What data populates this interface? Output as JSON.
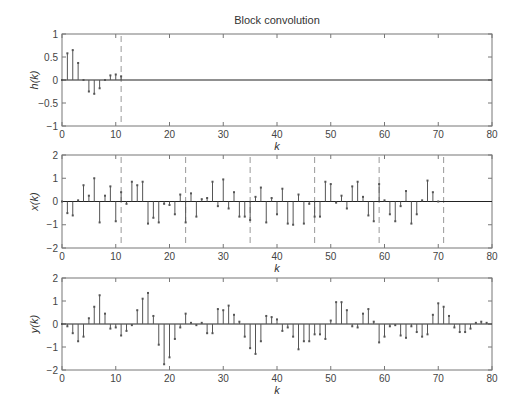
{
  "title": "Block convolution",
  "chart_data": [
    {
      "type": "stem",
      "title": "Block convolution",
      "xlabel": "k",
      "ylabel": "h(k)",
      "xlim": [
        0,
        80
      ],
      "ylim": [
        -1,
        1
      ],
      "xticks": [
        0,
        10,
        20,
        30,
        40,
        50,
        60,
        70,
        80
      ],
      "yticks": [
        -1,
        -0.5,
        0,
        0.5,
        1
      ],
      "ytick_labels": [
        "−1",
        "−0.5",
        "0",
        "0.5",
        "1"
      ],
      "block_boundaries": [
        11
      ],
      "x": [
        0,
        1,
        2,
        3,
        4,
        5,
        6,
        7,
        8,
        9,
        10,
        11
      ],
      "values": [
        0,
        0.58,
        0.65,
        0.37,
        0,
        -0.25,
        -0.3,
        -0.18,
        0,
        0.1,
        0.12,
        0.08
      ]
    },
    {
      "type": "stem",
      "xlabel": "k",
      "ylabel": "x(k)",
      "xlim": [
        0,
        80
      ],
      "ylim": [
        -2,
        2
      ],
      "xticks": [
        0,
        10,
        20,
        30,
        40,
        50,
        60,
        70,
        80
      ],
      "yticks": [
        -2,
        -1,
        0,
        1,
        2
      ],
      "ytick_labels": [
        "−2",
        "−1",
        "0",
        "1",
        "2"
      ],
      "block_boundaries": [
        11,
        23,
        35,
        47,
        59,
        71
      ],
      "x": [
        0,
        1,
        2,
        3,
        4,
        5,
        6,
        7,
        8,
        9,
        10,
        11,
        12,
        13,
        14,
        15,
        16,
        17,
        18,
        19,
        20,
        21,
        22,
        23,
        24,
        25,
        26,
        27,
        28,
        29,
        30,
        31,
        32,
        33,
        34,
        35,
        36,
        37,
        38,
        39,
        40,
        41,
        42,
        43,
        44,
        45,
        46,
        47,
        48,
        49,
        50,
        51,
        52,
        53,
        54,
        55,
        56,
        57,
        58,
        59,
        60,
        61,
        62,
        63,
        64,
        65,
        66,
        67,
        68,
        69,
        70
      ],
      "values": [
        0,
        -0.5,
        -0.6,
        0.05,
        0.7,
        0.25,
        1.0,
        -0.9,
        0.25,
        0.65,
        -0.85,
        0.4,
        -0.1,
        0.85,
        0.7,
        0.85,
        -0.95,
        -0.7,
        -0.9,
        -0.1,
        -0.15,
        -0.55,
        0.3,
        -0.9,
        0.35,
        -0.65,
        0.1,
        0.15,
        0.85,
        -0.2,
        0.95,
        -0.3,
        0.4,
        -0.65,
        -0.65,
        -0.8,
        0.2,
        0.6,
        -0.9,
        0.15,
        -0.55,
        0.55,
        -0.95,
        -1.0,
        0.3,
        -0.95,
        -0.1,
        -0.65,
        -0.65,
        0.85,
        0.75,
        -0.05,
        0.25,
        -0.3,
        0.65,
        0.85,
        0.2,
        -0.6,
        -0.85,
        0.75,
        0.05,
        -0.55,
        -0.85,
        -0.2,
        0.45,
        -0.95,
        -0.55,
        0.05,
        0.9,
        0.4,
        0
      ]
    },
    {
      "type": "stem",
      "xlabel": "k",
      "ylabel": "y(k)",
      "xlim": [
        0,
        80
      ],
      "ylim": [
        -2,
        2
      ],
      "xticks": [
        0,
        10,
        20,
        30,
        40,
        50,
        60,
        70,
        80
      ],
      "yticks": [
        -2,
        -1,
        0,
        1,
        2
      ],
      "ytick_labels": [
        "−2",
        "−1",
        "0",
        "1",
        "2"
      ],
      "block_boundaries": [],
      "x": [
        0,
        1,
        2,
        3,
        4,
        5,
        6,
        7,
        8,
        9,
        10,
        11,
        12,
        13,
        14,
        15,
        16,
        17,
        18,
        19,
        20,
        21,
        22,
        23,
        24,
        25,
        26,
        27,
        28,
        29,
        30,
        31,
        32,
        33,
        34,
        35,
        36,
        37,
        38,
        39,
        40,
        41,
        42,
        43,
        44,
        45,
        46,
        47,
        48,
        49,
        50,
        51,
        52,
        53,
        54,
        55,
        56,
        57,
        58,
        59,
        60,
        61,
        62,
        63,
        64,
        65,
        66,
        67,
        68,
        69,
        70,
        71,
        72,
        73,
        74,
        75,
        76,
        77,
        78,
        79
      ],
      "values": [
        0,
        -0.1,
        -0.4,
        -0.75,
        -0.55,
        0.25,
        0.75,
        1.25,
        0.45,
        -0.2,
        -0.15,
        -0.5,
        -0.3,
        -0.05,
        0.6,
        1.1,
        1.35,
        0.35,
        -0.9,
        -1.75,
        -1.45,
        -0.65,
        -0.15,
        0.45,
        0.05,
        -0.05,
        0.05,
        -0.4,
        -0.4,
        0.65,
        0.6,
        0.8,
        0.4,
        0.1,
        -0.55,
        -1.05,
        -1.3,
        -0.75,
        0.35,
        0.3,
        0.2,
        -0.3,
        -0.15,
        -0.55,
        -1.1,
        -0.75,
        -0.75,
        -0.45,
        -0.45,
        -0.65,
        0.15,
        0.95,
        0.95,
        0.6,
        -0.1,
        -0.15,
        0.45,
        0.65,
        0.1,
        -0.8,
        -0.55,
        -0.1,
        -0.05,
        -0.5,
        -0.6,
        -0.1,
        -0.35,
        -0.55,
        -0.45,
        0.4,
        0.9,
        0.75,
        0.35,
        -0.15,
        -0.35,
        -0.35,
        -0.2,
        0.05,
        0.1,
        0.05
      ]
    }
  ],
  "layout": {
    "plot_left": 62,
    "plot_right": 492,
    "panels": [
      {
        "top": 34,
        "bottom": 126
      },
      {
        "top": 155,
        "bottom": 248
      },
      {
        "top": 278,
        "bottom": 370
      }
    ]
  },
  "colors": {
    "axis": "#777777",
    "stem": "#555555",
    "baseline": "#222222",
    "dashed": "#999999"
  }
}
